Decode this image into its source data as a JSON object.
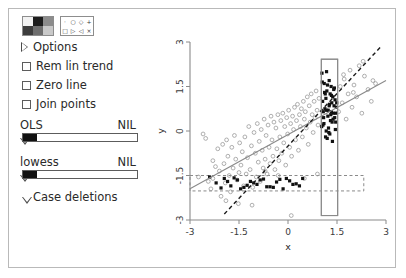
{
  "panel": {
    "color_palette": {
      "name": "color-palette",
      "swatches": [
        "#f2f2f2",
        "#1d1d1d",
        "#8c8c8c",
        "#3d3d3d",
        "#6e6e6e",
        "#c9c9c9"
      ]
    },
    "symbol_palette": {
      "name": "symbol-palette",
      "symbols": [
        "·",
        "○",
        "◇",
        "+",
        "□",
        "▷",
        "◁",
        "×"
      ]
    },
    "options_label": "Options",
    "checkboxes": [
      {
        "label": "Rem lin trend",
        "checked": false
      },
      {
        "label": "Zero line",
        "checked": false
      },
      {
        "label": "Join points",
        "checked": false
      }
    ],
    "sliders": [
      {
        "label": "OLS",
        "value": "NIL",
        "fill_pct": 12
      },
      {
        "label": "lowess",
        "value": "NIL",
        "fill_pct": 12
      }
    ],
    "case_deletions_label": "Case deletions"
  },
  "chart_data": {
    "type": "scatter",
    "title": "",
    "xlabel": "x",
    "ylabel": "y",
    "xlim": [
      -3,
      3
    ],
    "ylim": [
      -3,
      3
    ],
    "xticks": [
      -3,
      -1.5,
      0,
      1.5,
      3
    ],
    "xticklabels": [
      "-3",
      "-1.5",
      "0",
      "1.5",
      "3"
    ],
    "yticks": [
      -3,
      -1.5,
      0,
      1.5,
      3
    ],
    "yticklabels": [
      "-3",
      "-1.5",
      "0",
      "1.5",
      "3"
    ],
    "grid": false,
    "legend": "none",
    "colors": {
      "unselected_point": "#9a9a9a",
      "selected_point": "#111111",
      "ols_line": "#8a8a8a",
      "dashed_line": "#1a1a1a",
      "brush": "#8a8a8a",
      "band": "#8a8a8a",
      "axis": "#8a8a8a"
    },
    "series": [
      {
        "name": "unselected",
        "marker": "open-circle",
        "x": [
          -2.74,
          -2.52,
          -2.44,
          -2.36,
          -2.3,
          -2.22,
          -2.15,
          -2.1,
          -2.05,
          -2.0,
          -1.96,
          -1.92,
          -1.88,
          -1.84,
          -1.8,
          -1.76,
          -1.72,
          -1.68,
          -1.64,
          -1.6,
          -1.56,
          -1.52,
          -1.48,
          -1.44,
          -1.4,
          -1.36,
          -1.32,
          -1.28,
          -1.24,
          -1.2,
          -1.16,
          -1.12,
          -1.08,
          -1.04,
          -1.0,
          -0.97,
          -0.94,
          -0.91,
          -0.88,
          -0.85,
          -0.82,
          -0.79,
          -0.76,
          -0.73,
          -0.7,
          -0.67,
          -0.64,
          -0.61,
          -0.58,
          -0.55,
          -0.52,
          -0.49,
          -0.46,
          -0.43,
          -0.4,
          -0.37,
          -0.34,
          -0.31,
          -0.28,
          -0.25,
          -0.22,
          -0.19,
          -0.16,
          -0.13,
          -0.1,
          -0.07,
          -0.04,
          -0.01,
          0.02,
          0.05,
          0.08,
          0.11,
          0.14,
          0.17,
          0.2,
          0.23,
          0.26,
          0.29,
          0.32,
          0.35,
          0.38,
          0.41,
          0.44,
          0.47,
          0.5,
          0.53,
          0.56,
          0.59,
          0.62,
          0.65,
          0.68,
          0.71,
          0.74,
          0.77,
          0.8,
          0.83,
          0.86,
          0.89,
          0.92,
          0.95,
          1.55,
          1.6,
          1.66,
          1.72,
          1.78,
          1.84,
          1.9,
          1.96,
          2.02,
          2.1,
          2.18,
          2.26,
          2.34,
          2.45,
          2.55,
          2.68,
          -2.6,
          -2.3,
          -1.9,
          -1.5,
          -1.1,
          -0.7,
          -0.3,
          0.1,
          0.5,
          0.9,
          1.7,
          2.0,
          2.3,
          2.6
        ],
        "y": [
          -1.55,
          -0.25,
          -1.7,
          -1.95,
          -1.0,
          -1.2,
          -0.6,
          -1.35,
          -2.2,
          -0.45,
          -1.1,
          -1.75,
          -0.3,
          -0.85,
          -1.5,
          -2.05,
          -0.55,
          -1.25,
          -0.15,
          -0.95,
          -1.65,
          -2.45,
          -0.4,
          -1.15,
          -0.7,
          -1.85,
          -0.2,
          -1.45,
          -0.9,
          0.15,
          -1.3,
          -0.5,
          -1.9,
          -0.05,
          -0.75,
          -1.55,
          0.25,
          -1.05,
          -0.35,
          -1.7,
          0.05,
          -0.65,
          -1.25,
          0.4,
          -0.95,
          -0.15,
          -1.45,
          0.2,
          -0.55,
          -1.1,
          0.5,
          -0.3,
          -0.85,
          0.3,
          -1.3,
          0.1,
          -0.6,
          0.55,
          -1.0,
          -0.2,
          0.35,
          -0.75,
          0.6,
          -0.4,
          0.15,
          -1.15,
          0.45,
          -0.1,
          0.7,
          -0.55,
          0.25,
          -0.85,
          0.5,
          0.05,
          0.8,
          -0.3,
          0.35,
          0.9,
          -0.65,
          0.55,
          0.15,
          0.75,
          -0.2,
          1.0,
          0.4,
          0.65,
          0.1,
          1.15,
          -0.45,
          0.85,
          0.3,
          1.25,
          0.55,
          -0.05,
          1.0,
          0.45,
          1.35,
          0.7,
          0.2,
          1.1,
          0.65,
          1.5,
          0.95,
          1.75,
          0.4,
          1.25,
          2.05,
          0.8,
          1.55,
          1.15,
          2.2,
          0.6,
          1.85,
          1.4,
          1.0,
          1.6,
          -0.1,
          -1.6,
          -2.35,
          -1.4,
          -2.5,
          -1.35,
          -1.5,
          -2.85,
          -1.6,
          -1.45,
          1.9,
          1.3,
          2.35,
          1.7
        ]
      },
      {
        "name": "selected",
        "marker": "filled-square",
        "x": [
          1.03,
          1.06,
          1.09,
          1.12,
          1.15,
          1.18,
          1.21,
          1.24,
          1.27,
          1.3,
          1.33,
          1.36,
          1.39,
          1.42,
          1.45,
          1.48,
          1.05,
          1.1,
          1.16,
          1.22,
          1.28,
          1.34,
          1.4,
          1.46,
          1.08,
          1.14,
          1.2,
          1.26,
          1.32,
          1.38,
          1.44,
          1.07,
          1.13,
          1.19,
          1.25,
          1.31,
          1.37,
          1.43,
          1.49,
          1.11,
          1.17,
          1.23,
          1.29,
          1.35,
          1.41,
          1.47,
          1.04,
          1.26,
          1.33,
          1.18,
          -2.2,
          -1.95,
          -1.75,
          -1.55,
          -1.35,
          -1.15,
          -0.95,
          -0.75,
          -0.55,
          -0.35,
          -0.15,
          0.05,
          0.25,
          0.45,
          -2.4,
          -2.05,
          -1.65,
          -1.25,
          -0.85,
          -0.45,
          -0.05,
          0.35,
          -1.85,
          -1.45,
          -1.05,
          -0.65,
          -0.25,
          0.15
        ],
        "y": [
          0.15,
          1.0,
          0.45,
          1.3,
          -0.2,
          0.7,
          1.55,
          0.1,
          0.9,
          0.35,
          1.2,
          -0.35,
          0.6,
          1.45,
          0.05,
          0.8,
          1.65,
          0.25,
          1.1,
          0.5,
          -0.1,
          0.95,
          1.4,
          0.3,
          0.65,
          1.25,
          -0.25,
          0.85,
          1.5,
          0.4,
          1.05,
          0.2,
          0.75,
          1.35,
          -0.05,
          0.55,
          1.15,
          0.45,
          0.95,
          1.6,
          0.0,
          0.7,
          1.25,
          0.3,
          0.85,
          0.6,
          1.95,
          1.7,
          0.65,
          2.0,
          -1.75,
          -1.6,
          -1.85,
          -1.65,
          -1.9,
          -1.7,
          -1.8,
          -1.62,
          -1.88,
          -1.72,
          -1.95,
          -1.68,
          -1.78,
          -1.6,
          -1.55,
          -1.92,
          -1.58,
          -1.83,
          -1.65,
          -1.9,
          -1.6,
          -1.85,
          -1.7,
          -1.95,
          -1.75,
          -1.88,
          -1.63,
          -1.8
        ]
      }
    ],
    "annotations": [
      {
        "name": "ols-line",
        "type": "line",
        "style": "solid",
        "x0": -3.0,
        "y0": -1.95,
        "x1": 3.0,
        "y1": 1.7
      },
      {
        "name": "alternate-fit-line",
        "type": "line",
        "style": "dashed",
        "x0": -1.95,
        "y0": -2.8,
        "x1": 2.85,
        "y1": 2.85
      },
      {
        "name": "brush-rectangle",
        "type": "rect",
        "style": "solid",
        "x0": 1.02,
        "x1": 1.52,
        "y0": -2.85,
        "y1": 2.42
      },
      {
        "name": "selection-band",
        "type": "rect",
        "style": "dashed",
        "x0": -3.0,
        "x1": 2.32,
        "y0": -2.02,
        "y1": -1.5
      }
    ]
  }
}
